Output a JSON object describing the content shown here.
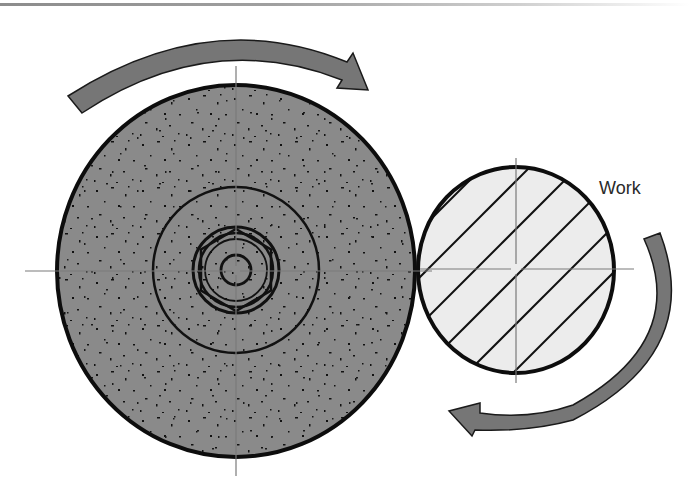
{
  "diagram": {
    "labels": {
      "work": "Work"
    },
    "colors": {
      "wheel_fill": "#8a8a8a",
      "work_fill": "#ececec",
      "arrow_fill": "#767676",
      "outline": "#111111",
      "centerline": "#888888"
    },
    "elements": [
      {
        "id": "grinding-wheel",
        "shape": "circle",
        "center": [
          236,
          271
        ],
        "rx": 179,
        "ry": 186,
        "texture": "speckled"
      },
      {
        "id": "wheel-flange",
        "shape": "circle",
        "center": [
          236,
          271
        ],
        "r": 83
      },
      {
        "id": "wheel-nut",
        "shape": "hex-ring",
        "center": [
          236,
          270
        ],
        "r": 43
      },
      {
        "id": "wheel-arbor",
        "shape": "circle",
        "center": [
          236,
          270
        ],
        "r": 16
      },
      {
        "id": "workpiece",
        "shape": "circle",
        "center": [
          516,
          270
        ],
        "rx": 98,
        "ry": 103,
        "texture": "hatched"
      },
      {
        "id": "wheel-rotation-arrow",
        "direction": "clockwise"
      },
      {
        "id": "work-rotation-arrow",
        "direction": "clockwise"
      }
    ]
  }
}
